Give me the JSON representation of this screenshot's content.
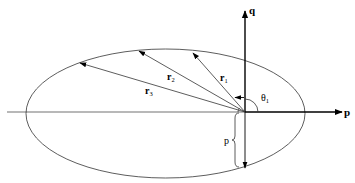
{
  "diagram": {
    "colors": {
      "stroke": "#000000",
      "thin": "#333333",
      "background": "#ffffff"
    },
    "axes": {
      "horizontal_label": "p",
      "vertical_label": "q"
    },
    "vectors": [
      {
        "label": "r",
        "subscript": "1"
      },
      {
        "label": "r",
        "subscript": "2"
      },
      {
        "label": "r",
        "subscript": "3"
      }
    ],
    "angle": {
      "label": "θ",
      "subscript": "1"
    },
    "semi_latus_rectum": {
      "label": "p"
    }
  }
}
